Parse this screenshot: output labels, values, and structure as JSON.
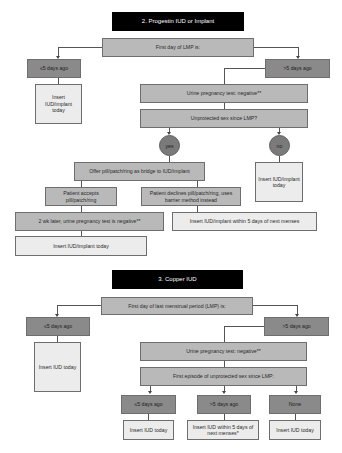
{
  "section2": {
    "title": "2. Progestin IUD or Implant",
    "first_day": "First day of LMP is:",
    "le5": "≤5 days ago",
    "gt5": ">5 days ago",
    "insert_left": "Insert IUD/implant today",
    "urine_test": "Urine pregnancy test: negative**",
    "unprotected": "Unprotected sex since LMP?",
    "yes": "yes",
    "no": "no",
    "offer": "Offer pill/patch/ring as bridge to IUD/implant",
    "insert_no": "Insert IUD/implant today",
    "accepts": "Patient accepts pill/patch/ring",
    "declines": "Patient declines pill/patch/ring, uses barrier method instead",
    "two_wk": "2 wk later, urine pregnancy test is negative**",
    "within5": "Insert IUD/implant within 5 days of next menses",
    "insert_today": "Insert IUD/implant today"
  },
  "section3": {
    "title": "3. Copper IUD",
    "first_day": "First day of last menstrual period (LMP) is:",
    "le5": "≤5 days ago",
    "gt5": ">5 days ago",
    "insert_left": "Insert IUD today",
    "urine_test": "Urine pregnancy test: negative**",
    "first_episode": "First episode of unprotected sex since LMP:",
    "ep_le5": "≤5 days ago",
    "ep_gt5": ">5 days ago",
    "ep_none": "None",
    "out_le5": "Insert IUD today",
    "out_gt5": "Insert IUD within 5 days of next menses*",
    "out_none": "Insert IUD today"
  },
  "colors": {
    "title_bg": "#000000",
    "mid": "#b9b9b9",
    "dark": "#8a8a8a",
    "light": "#ececec"
  }
}
